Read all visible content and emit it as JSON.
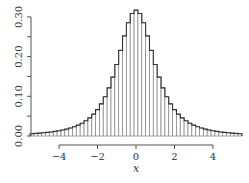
{
  "chart_data": {
    "type": "bar",
    "subtype": "histogram",
    "title": "",
    "xlabel": "x",
    "ylabel": "",
    "xlim": [
      -5.5,
      5.5
    ],
    "ylim": [
      0.0,
      0.32
    ],
    "grid": false,
    "legend": null,
    "bin_width": 0.2,
    "x_ticks": [
      -4,
      -2,
      0,
      2,
      4
    ],
    "x_tick_labels": [
      "−4",
      "−2",
      "0",
      "2",
      "4"
    ],
    "y_ticks": [
      0.0,
      0.05,
      0.1,
      0.15,
      0.2,
      0.25,
      0.3
    ],
    "y_tick_labels": [
      {
        "value": 0.0,
        "label": "0.00"
      },
      {
        "value": 0.1,
        "label": "0.10"
      },
      {
        "value": 0.2,
        "label": "0.20"
      },
      {
        "value": 0.3,
        "label": "0.30"
      }
    ],
    "categories": [
      -5.4,
      -5.2,
      -5.0,
      -4.8,
      -4.6,
      -4.4,
      -4.2,
      -4.0,
      -3.8,
      -3.6,
      -3.4,
      -3.2,
      -3.0,
      -2.8,
      -2.6,
      -2.4,
      -2.2,
      -2.0,
      -1.8,
      -1.6,
      -1.4,
      -1.2,
      -1.0,
      -0.8,
      -0.6,
      -0.4,
      -0.2,
      0.0,
      0.2,
      0.4,
      0.6,
      0.8,
      1.0,
      1.2,
      1.4,
      1.6,
      1.8,
      2.0,
      2.2,
      2.4,
      2.6,
      2.8,
      3.0,
      3.2,
      3.4,
      3.6,
      3.8,
      4.0,
      4.2,
      4.4,
      4.6,
      4.8,
      5.0,
      5.2,
      5.4
    ],
    "values": [
      0.0058,
      0.0065,
      0.0072,
      0.0081,
      0.0091,
      0.0102,
      0.0116,
      0.0132,
      0.0151,
      0.0174,
      0.0201,
      0.0234,
      0.0274,
      0.0322,
      0.0383,
      0.0457,
      0.055,
      0.0665,
      0.081,
      0.099,
      0.1213,
      0.1483,
      0.1801,
      0.2156,
      0.2521,
      0.2851,
      0.3085,
      0.317,
      0.3085,
      0.2851,
      0.2521,
      0.2156,
      0.1801,
      0.1483,
      0.1213,
      0.099,
      0.081,
      0.0665,
      0.055,
      0.0457,
      0.0383,
      0.0322,
      0.0274,
      0.0234,
      0.0201,
      0.0174,
      0.0151,
      0.0132,
      0.0116,
      0.0102,
      0.0091,
      0.0081,
      0.0072,
      0.0065,
      0.0058
    ],
    "colors": {
      "bar_fill": "#ffffff",
      "bar_stroke": "#8c8c8c",
      "outline": "#333333",
      "axis": "#555555"
    }
  }
}
